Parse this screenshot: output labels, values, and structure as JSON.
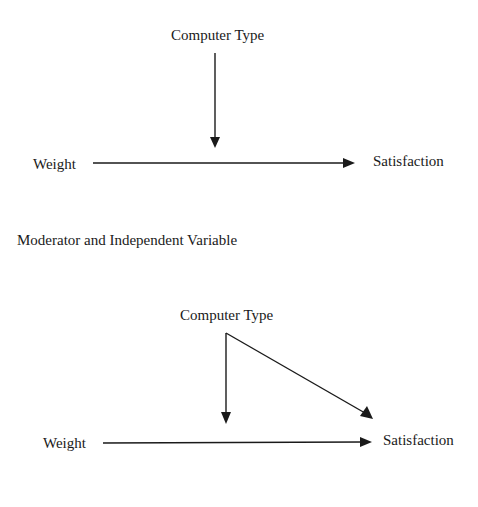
{
  "diagram1": {
    "moderator": "Computer Type",
    "independent": "Weight",
    "dependent": "Satisfaction",
    "edges": [
      {
        "from": "Computer Type",
        "to": "Weight→Satisfaction path",
        "type": "moderation"
      },
      {
        "from": "Weight",
        "to": "Satisfaction",
        "type": "direct"
      }
    ]
  },
  "caption": "Moderator and Independent Variable",
  "diagram2": {
    "moderator": "Computer Type",
    "independent": "Weight",
    "dependent": "Satisfaction",
    "edges": [
      {
        "from": "Computer Type",
        "to": "Weight→Satisfaction path",
        "type": "moderation"
      },
      {
        "from": "Computer Type",
        "to": "Satisfaction",
        "type": "direct"
      },
      {
        "from": "Weight",
        "to": "Satisfaction",
        "type": "direct"
      }
    ]
  },
  "colors": {
    "line": "#1a1a1a",
    "background": "#ffffff"
  }
}
